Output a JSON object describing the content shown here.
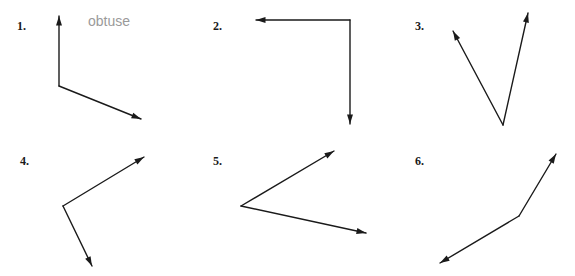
{
  "page": {
    "background_color": "#ffffff",
    "stroke_color": "#1a1a1a",
    "answer_text_color": "#9a9a9a",
    "width": 575,
    "height": 276,
    "columns": 3,
    "rows": 2
  },
  "problems": [
    {
      "number": "1.",
      "answer": "obtuse",
      "answer_filled": true,
      "angle_type": "obtuse",
      "panel_origin": [
        0,
        0
      ],
      "number_position": [
        17,
        20
      ],
      "answer_position": [
        88,
        14
      ],
      "vertex": [
        59,
        86
      ],
      "rays": [
        {
          "name": "ray-up",
          "tip": [
            59,
            16
          ],
          "arrow": true
        },
        {
          "name": "ray-lower-right",
          "tip": [
            141,
            119
          ],
          "arrow": true
        }
      ]
    },
    {
      "number": "2.",
      "answer": "",
      "answer_filled": false,
      "angle_type": "right",
      "panel_origin": [
        0,
        0
      ],
      "number_position": [
        213,
        20
      ],
      "answer_position": [
        284,
        14
      ],
      "vertex": [
        350,
        20
      ],
      "rays": [
        {
          "name": "ray-left",
          "tip": [
            256,
            20
          ],
          "arrow": true
        },
        {
          "name": "ray-down",
          "tip": [
            350,
            124
          ],
          "arrow": true
        }
      ]
    },
    {
      "number": "3.",
      "answer": "",
      "answer_filled": false,
      "angle_type": "acute",
      "panel_origin": [
        0,
        0
      ],
      "number_position": [
        415,
        20
      ],
      "answer_position": [
        486,
        14
      ],
      "vertex": [
        503,
        125
      ],
      "rays": [
        {
          "name": "ray-upper-left",
          "tip": [
            453,
            31
          ],
          "arrow": true
        },
        {
          "name": "ray-upper-right",
          "tip": [
            528,
            13
          ],
          "arrow": true
        }
      ]
    },
    {
      "number": "4.",
      "answer": "",
      "answer_filled": false,
      "angle_type": "right",
      "panel_origin": [
        0,
        138
      ],
      "number_position": [
        20,
        155
      ],
      "answer_position": [
        91,
        149
      ],
      "vertex": [
        63,
        206
      ],
      "rays": [
        {
          "name": "ray-upper-right",
          "tip": [
            144,
            157
          ],
          "arrow": true
        },
        {
          "name": "ray-lower-right",
          "tip": [
            92,
            266
          ],
          "arrow": true
        }
      ]
    },
    {
      "number": "5.",
      "answer": "",
      "answer_filled": false,
      "angle_type": "acute",
      "panel_origin": [
        0,
        138
      ],
      "number_position": [
        213,
        155
      ],
      "answer_position": [
        284,
        149
      ],
      "vertex": [
        241,
        206
      ],
      "rays": [
        {
          "name": "ray-upper-right",
          "tip": [
            334,
            151
          ],
          "arrow": true
        },
        {
          "name": "ray-lower-right",
          "tip": [
            366,
            233
          ],
          "arrow": true
        }
      ]
    },
    {
      "number": "6.",
      "answer": "",
      "answer_filled": false,
      "angle_type": "obtuse",
      "panel_origin": [
        0,
        138
      ],
      "number_position": [
        415,
        155
      ],
      "answer_position": [
        486,
        149
      ],
      "vertex": [
        519,
        216
      ],
      "rays": [
        {
          "name": "ray-upper-right",
          "tip": [
            556,
            154
          ],
          "arrow": true
        },
        {
          "name": "ray-lower-left",
          "tip": [
            440,
            263
          ],
          "arrow": true
        }
      ]
    }
  ]
}
